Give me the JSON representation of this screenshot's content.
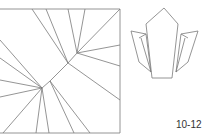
{
  "figure": {
    "label": "10-12",
    "crease_pattern": {
      "description": "square crease pattern",
      "stroke": "#777777"
    },
    "folded_model": {
      "description": "folded origami model outline",
      "stroke": "#777777"
    }
  }
}
